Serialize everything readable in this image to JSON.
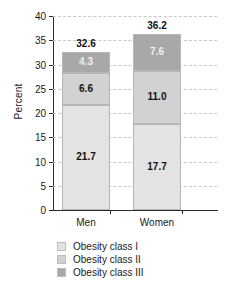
{
  "chart_data": {
    "type": "bar",
    "subtype": "stacked-bar",
    "title": "",
    "xlabel": "",
    "ylabel": "Percent",
    "categories": [
      "Men",
      "Women"
    ],
    "series": [
      {
        "name": "Obesity class I",
        "values": [
          21.7,
          17.7
        ],
        "color": "#e3e3e3"
      },
      {
        "name": "Obesity class II",
        "values": [
          6.6,
          11.0
        ],
        "color": "#d2d2d2"
      },
      {
        "name": "Obesity class III",
        "values": [
          4.3,
          7.6
        ],
        "color": "#a8a8a8"
      }
    ],
    "totals": [
      32.6,
      36.2
    ],
    "ylim": [
      0,
      40
    ],
    "yticks": [
      0,
      5,
      10,
      15,
      20,
      25,
      30,
      35,
      40
    ],
    "ytick_labels": [
      "0",
      "5",
      "10",
      "15",
      "20",
      "25",
      "30",
      "35",
      "40"
    ],
    "grid": true,
    "grid_axis": "y",
    "grid_style": "dashed",
    "legend_position": "bottom",
    "stacked": true
  },
  "axis": {
    "ylabel": "Percent"
  },
  "bars": [
    {
      "category": "Men",
      "total_label": "32.6",
      "segments": [
        {
          "label": "21.7",
          "value": 21.7,
          "class": "Obesity class I"
        },
        {
          "label": "6.6",
          "value": 6.6,
          "class": "Obesity class II"
        },
        {
          "label": "4.3",
          "value": 4.3,
          "class": "Obesity class III"
        }
      ]
    },
    {
      "category": "Women",
      "total_label": "36.2",
      "segments": [
        {
          "label": "17.7",
          "value": 17.7,
          "class": "Obesity class I"
        },
        {
          "label": "11.0",
          "value": 11.0,
          "class": "Obesity class II"
        },
        {
          "label": "7.6",
          "value": 7.6,
          "class": "Obesity class III"
        }
      ]
    }
  ],
  "legend": {
    "items": [
      {
        "label": "Obesity class I",
        "color": "#e3e3e3"
      },
      {
        "label": "Obesity class II",
        "color": "#d2d2d2"
      },
      {
        "label": "Obesity class III",
        "color": "#a8a8a8"
      }
    ]
  }
}
